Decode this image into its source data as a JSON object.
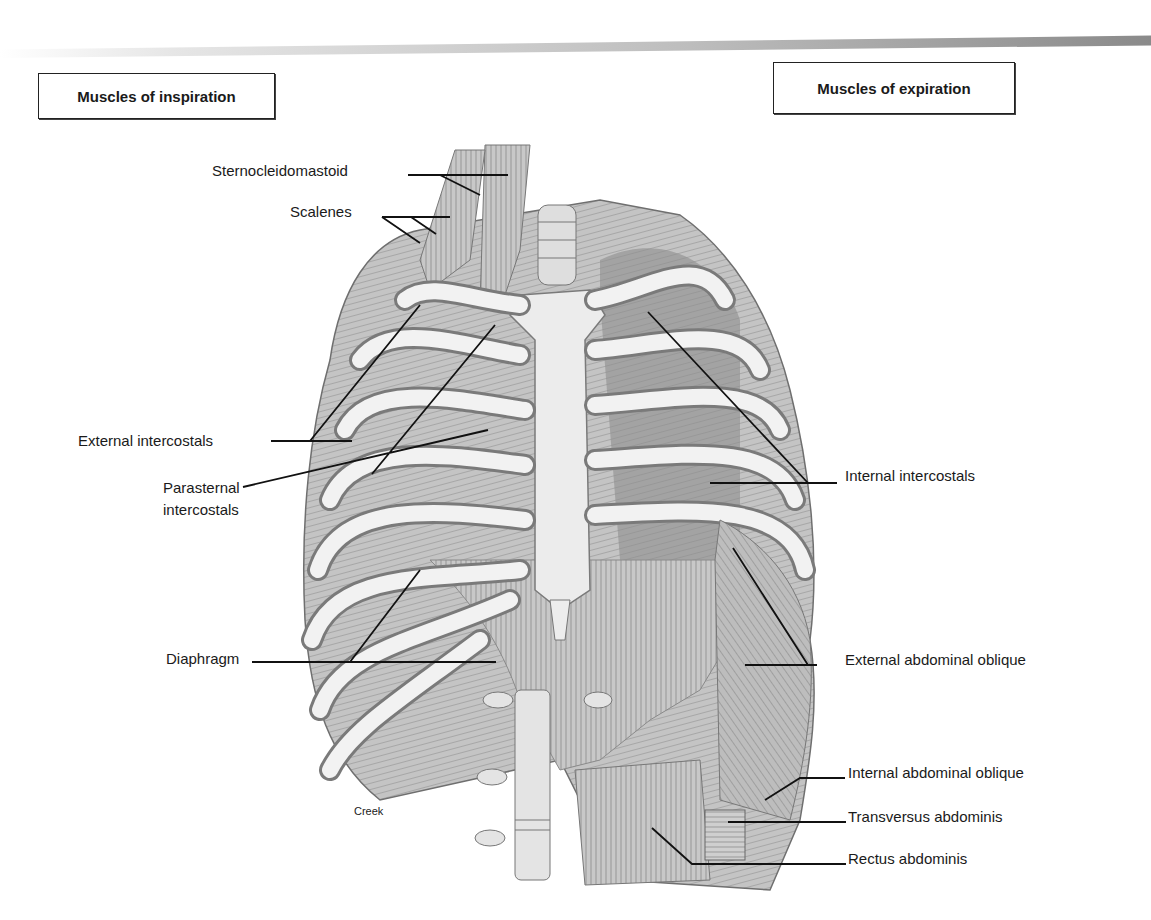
{
  "figure": {
    "headings": {
      "inspiration": "Muscles of inspiration",
      "expiration": "Muscles of expiration"
    },
    "labels_inspiration": [
      {
        "id": "sternocleidomastoid",
        "text": "Sternocleidomastoid"
      },
      {
        "id": "scalenes",
        "text": "Scalenes"
      },
      {
        "id": "external-intercostals",
        "text": "External intercostals"
      },
      {
        "id": "parasternal-intercostals",
        "line1": "Parasternal",
        "line2": "intercostals"
      },
      {
        "id": "diaphragm",
        "text": "Diaphragm"
      }
    ],
    "labels_expiration": [
      {
        "id": "internal-intercostals",
        "text": "Internal intercostals"
      },
      {
        "id": "external-abdominal-oblique",
        "text": "External abdominal oblique"
      },
      {
        "id": "internal-abdominal-oblique",
        "text": "Internal abdominal oblique"
      },
      {
        "id": "transversus-abdominis",
        "text": "Transversus abdominis"
      },
      {
        "id": "rectus-abdominis",
        "text": "Rectus abdominis"
      }
    ],
    "artist_credit": "Creek",
    "colors": {
      "text": "#1a1a1a",
      "leader_line": "#111111",
      "bone": "#efefef",
      "muscle": "#b8b8b8",
      "shadow": "#7a7a7a"
    }
  }
}
